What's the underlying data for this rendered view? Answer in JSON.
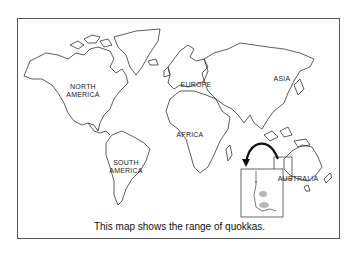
{
  "map": {
    "title": "World map with quokka range inset",
    "caption": "This map shows the range of quokkas.",
    "continents": [
      {
        "id": "north-america",
        "label_line1": "NORTH",
        "label_line2": "AMERICA"
      },
      {
        "id": "south-america",
        "label_line1": "SOUTH",
        "label_line2": "AMERICA"
      },
      {
        "id": "europe",
        "label_line1": "EUROPE",
        "label_line2": ""
      },
      {
        "id": "africa",
        "label_line1": "AFRICA",
        "label_line2": ""
      },
      {
        "id": "asia",
        "label_line1": "ASIA",
        "label_line2": ""
      },
      {
        "id": "australia",
        "label_line1": "AUSTRALIA",
        "label_line2": ""
      }
    ],
    "inset": {
      "description": "Enlarged view of southwestern Australia showing quokka range",
      "range_color": "#b8b8b8"
    },
    "colors": {
      "outline": "#333333",
      "frame": "#555555",
      "arrow": "#111111"
    }
  }
}
